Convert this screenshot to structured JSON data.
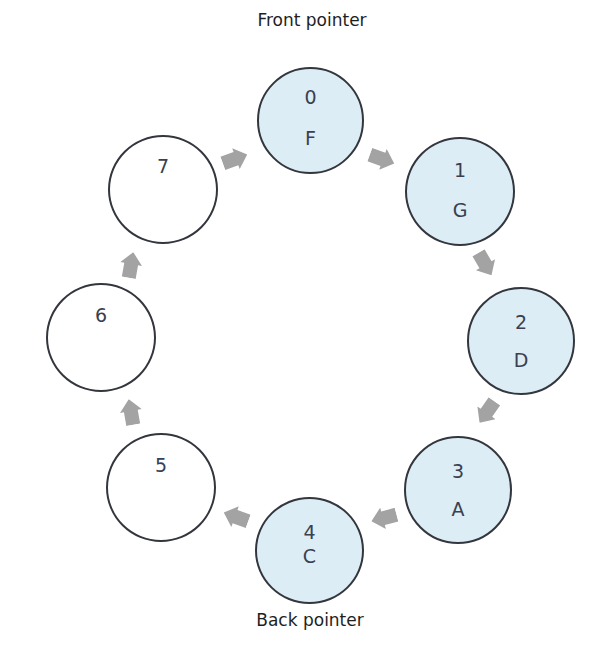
{
  "labels": {
    "front": "Front pointer",
    "back": "Back pointer"
  },
  "colors": {
    "filled": "#dcedf5",
    "empty": "#ffffff",
    "stroke": "#33363d",
    "arrow": "#a3a3a3",
    "text": "#3a4050"
  },
  "nodes": [
    {
      "index": "0",
      "value": "F",
      "filled": true
    },
    {
      "index": "1",
      "value": "G",
      "filled": true
    },
    {
      "index": "2",
      "value": "D",
      "filled": true
    },
    {
      "index": "3",
      "value": "A",
      "filled": true
    },
    {
      "index": "4",
      "value": "C",
      "filled": true
    },
    {
      "index": "5",
      "value": "",
      "filled": false
    },
    {
      "index": "6",
      "value": "",
      "filled": false
    },
    {
      "index": "7",
      "value": "",
      "filled": false
    }
  ],
  "edges": [
    {
      "from": "0",
      "to": "1"
    },
    {
      "from": "1",
      "to": "2"
    },
    {
      "from": "2",
      "to": "3"
    },
    {
      "from": "3",
      "to": "4"
    },
    {
      "from": "4",
      "to": "5"
    },
    {
      "from": "5",
      "to": "6"
    },
    {
      "from": "6",
      "to": "7"
    },
    {
      "from": "7",
      "to": "0"
    }
  ]
}
